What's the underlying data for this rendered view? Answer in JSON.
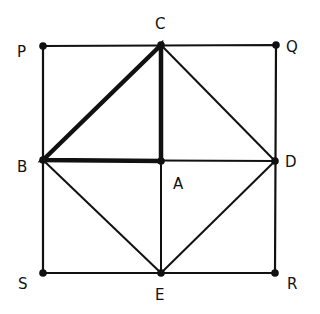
{
  "diagram": {
    "points": {
      "P": {
        "label": "P",
        "x": 43,
        "y": 46
      },
      "C": {
        "label": "C",
        "x": 161,
        "y": 45
      },
      "Q": {
        "label": "Q",
        "x": 276,
        "y": 45
      },
      "B": {
        "label": "B",
        "x": 43,
        "y": 160
      },
      "A": {
        "label": "A",
        "x": 161,
        "y": 161
      },
      "D": {
        "label": "D",
        "x": 275,
        "y": 161
      },
      "S": {
        "label": "S",
        "x": 43,
        "y": 273
      },
      "E": {
        "label": "E",
        "x": 161,
        "y": 273
      },
      "R": {
        "label": "R",
        "x": 275,
        "y": 273
      }
    },
    "thin_segments": [
      "PQ",
      "QR",
      "RS",
      "SP",
      "BD",
      "CE",
      "CD",
      "DE",
      "EB"
    ],
    "thick_segments": [
      "BC",
      "CA",
      "AB"
    ],
    "colors": {
      "line": "#111111",
      "background": "#ffffff"
    }
  }
}
